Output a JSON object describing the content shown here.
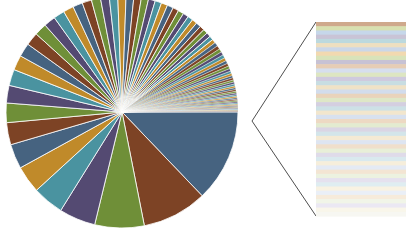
{
  "chart_data": {
    "type": "pie",
    "title": "",
    "subtitle": "",
    "xlabel": "",
    "ylabel": "",
    "legend": "none",
    "grid": false,
    "variant": "pie-of-pie",
    "pie": {
      "center_x": 122,
      "center_y": 112,
      "radius": 116,
      "start_angle_deg": 0,
      "direction": "counterclockwise",
      "categories": [
        "Item 1",
        "Item 2",
        "Item 3",
        "Item 4",
        "Item 5",
        "Item 6",
        "Item 7",
        "Item 8",
        "Item 9",
        "Item 10",
        "Item 11",
        "Item 12",
        "Item 13",
        "Item 14",
        "Item 15",
        "Item 16",
        "Item 17",
        "Item 18",
        "Item 19",
        "Item 20",
        "Item 21",
        "Item 22",
        "Item 23",
        "Item 24",
        "Item 25",
        "Item 26",
        "Item 27",
        "Item 28",
        "Item 29",
        "Item 30",
        "Item 31",
        "Item 32",
        "Item 33",
        "Item 34",
        "Item 35",
        "Item 36",
        "Item 37",
        "Item 38",
        "Item 39",
        "Item 40",
        "Item 41",
        "Item 42",
        "Item 43",
        "Item 44",
        "Item 45",
        "Item 46",
        "Item 47",
        "Item 48",
        "Item 49",
        "Item 50",
        "Item 51",
        "Item 52",
        "Item 53",
        "Item 54",
        "Item 55",
        "Item 56",
        "Item 57",
        "Item 58",
        "Item 59",
        "Item 60",
        "Item 61",
        "Item 62",
        "Item 63",
        "Item 64",
        "Item 65",
        "Item 66",
        "Item 67",
        "Item 68",
        "Item 69",
        "Item 70",
        "Item 71",
        "Item 72",
        "Item 73",
        "Item 74",
        "Item 75",
        "Item 76",
        "Item 77",
        "Item 78",
        "Item 79",
        "Item 80"
      ],
      "values": [
        14.2,
        10.0,
        7.6,
        5.6,
        4.8,
        4.2,
        3.8,
        3.4,
        3.0,
        2.7,
        2.5,
        2.3,
        2.1,
        2.0,
        1.9,
        1.8,
        1.7,
        1.6,
        1.5,
        1.45,
        1.4,
        1.35,
        1.3,
        1.25,
        1.2,
        1.15,
        1.1,
        1.05,
        1.0,
        0.97,
        0.94,
        0.91,
        0.88,
        0.85,
        0.82,
        0.79,
        0.76,
        0.73,
        0.7,
        0.67,
        0.64,
        0.61,
        0.58,
        0.56,
        0.54,
        0.52,
        0.5,
        0.48,
        0.46,
        0.44,
        0.42,
        0.4,
        0.38,
        0.36,
        0.34,
        0.33,
        0.32,
        0.31,
        0.3,
        0.29,
        0.28,
        0.27,
        0.26,
        0.25,
        0.24,
        0.23,
        0.22,
        0.21,
        0.2,
        0.19,
        0.18,
        0.17,
        0.16,
        0.15,
        0.14,
        0.13,
        0.12,
        0.11,
        0.1,
        0.09
      ],
      "units": "percent"
    },
    "colors": {
      "palette": [
        "#466380",
        "#7d4325",
        "#6f8f38",
        "#544a72",
        "#4a93a0",
        "#c08a2a"
      ],
      "accent": "#466380",
      "background": "#ffffff",
      "leader_line": "#3a3a3a",
      "slice_edge": "#ffffff"
    },
    "detail_panel": {
      "type": "stacked-bar",
      "orientation": "vertical-stack",
      "x": 316,
      "y": 22,
      "width": 90,
      "height": 194,
      "segment_count": 46,
      "note": "Pastel / progressively faded tints of the main palette; segments fade out toward the bottom of the panel.",
      "segment_colors": [
        "#cfa98c",
        "#d8e0b0",
        "#c6d7ea",
        "#c9c4d6",
        "#bcd9de",
        "#eedfc0",
        "#cbd7e8",
        "#f2d9b0",
        "#d9e3ba",
        "#c7c2d4",
        "#e6cdb5",
        "#d6dfee",
        "#dde6c2",
        "#cfcade",
        "#c8dde2",
        "#f0e2c6",
        "#d2dcec",
        "#e9d3bb",
        "#dee7c7",
        "#d4cfe0",
        "#cde1e6",
        "#f2e6cd",
        "#d8e1ef",
        "#edd9c3",
        "#e3ebd0",
        "#dad5e4",
        "#d3e5ea",
        "#f4ead4",
        "#dee5f1",
        "#f0dfcb",
        "#e8efd8",
        "#dfdbe9",
        "#d9e9ee",
        "#f6eedb",
        "#e4eaf4",
        "#f3e5d3",
        "#ecf2e0",
        "#e5e1ee",
        "#dfedf1",
        "#f8f2e2",
        "#eaeff7",
        "#f6ebdb",
        "#f1f5e8",
        "#ebe8f3",
        "#f9f6ea",
        "#f7f7f2"
      ]
    },
    "leader_lines": [
      {
        "name": "upper-leader",
        "x1": 252,
        "y1": 121,
        "x2": 316,
        "y2": 22
      },
      {
        "name": "lower-leader",
        "x1": 252,
        "y1": 121,
        "x2": 316,
        "y2": 216
      }
    ]
  }
}
